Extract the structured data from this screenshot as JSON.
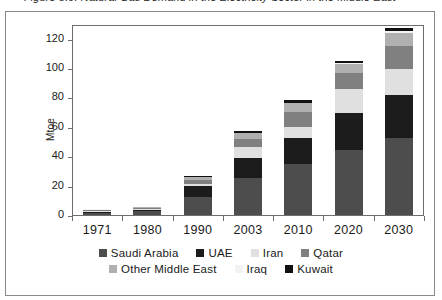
{
  "caption": {
    "text": "Figure 8.9: Natural Gas Demand in the Electricity Sector in the Middle East"
  },
  "chart_data": {
    "type": "bar",
    "stacked": true,
    "title": "",
    "xlabel": "",
    "ylabel": "Mtoe",
    "ylim": [
      0,
      130
    ],
    "yticks": [
      0,
      20,
      40,
      60,
      80,
      100,
      120
    ],
    "grid": false,
    "legend_position": "bottom",
    "categories": [
      "1971",
      "1980",
      "1990",
      "2003",
      "2010",
      "2020",
      "2030"
    ],
    "series": [
      {
        "name": "Saudi Arabia",
        "color": "#4d4d4d",
        "values": [
          1.5,
          2.5,
          12.0,
          25.0,
          34.5,
          44.5,
          52.5
        ]
      },
      {
        "name": "UAE",
        "color": "#1c1c1c",
        "values": [
          0.6,
          0.7,
          8.0,
          13.5,
          18.0,
          25.0,
          29.5
        ]
      },
      {
        "name": "Iran",
        "color": "#e0e0e0",
        "values": [
          0.5,
          0.8,
          1.2,
          7.5,
          7.5,
          16.5,
          17.5
        ]
      },
      {
        "name": "Qatar",
        "color": "#808080",
        "values": [
          0.6,
          0.7,
          2.6,
          6.0,
          10.0,
          11.0,
          15.5
        ]
      },
      {
        "name": "Other Middle East",
        "color": "#b0b0b0",
        "values": [
          0.5,
          0.5,
          2.0,
          3.5,
          6.0,
          6.0,
          9.0
        ]
      },
      {
        "name": "Iraq",
        "color": "#f2f2f2",
        "values": [
          0.2,
          0.2,
          0.3,
          0.5,
          0.5,
          0.6,
          1.0
        ]
      },
      {
        "name": "Kuwait",
        "color": "#111111",
        "values": [
          0.1,
          0.1,
          0.4,
          1.0,
          1.5,
          1.4,
          2.5
        ]
      }
    ],
    "totals": [
      4.0,
      5.5,
      26.5,
      57.0,
      78.0,
      105.0,
      127.5
    ]
  },
  "legend": {
    "row1": [
      "Saudi Arabia",
      "UAE",
      "Iran",
      "Qatar"
    ],
    "row2": [
      "Other Middle East",
      "Iraq",
      "Kuwait"
    ]
  }
}
